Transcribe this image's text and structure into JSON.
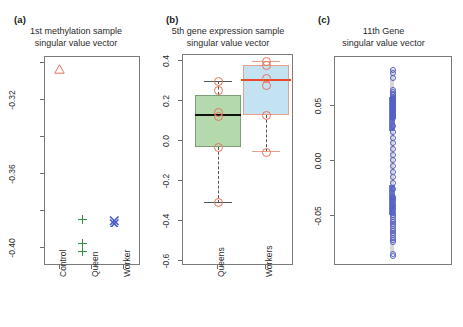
{
  "figure": {
    "background": "#ffffff",
    "width": 463,
    "height": 327
  },
  "panels": [
    {
      "letter": "(a)",
      "title_line1": "1st methylation sample",
      "title_line2": "singular value vector",
      "xlabels": [
        "Control",
        "Queen",
        "Worker"
      ],
      "ylabels": [
        "-0.32",
        "-0.36",
        "-0.40"
      ]
    },
    {
      "letter": "(b)",
      "title_line1": "5th gene expression sample",
      "title_line2": "singular value vector",
      "xlabels": [
        "Queens",
        "Workers"
      ],
      "ylabels": [
        "0.4",
        "0.2",
        "0.0",
        "-0.2",
        "-0.4",
        "-0.6"
      ]
    },
    {
      "letter": "(c)",
      "title_line1": "11th Gene",
      "title_line2": "singular value vector",
      "xlabels": [],
      "ylabels": [
        "0.05",
        "0.00",
        "-0.05"
      ]
    }
  ],
  "chart_data": [
    {
      "type": "scatter",
      "panel": "(a)",
      "title": "1st methylation sample singular value vector",
      "xlabel": "",
      "ylabel": "",
      "categories": [
        "Control",
        "Queen",
        "Worker"
      ],
      "ylim": [
        -0.415,
        -0.298
      ],
      "yticks": [
        -0.32,
        -0.36,
        -0.4
      ],
      "grid": false,
      "legend": "none",
      "series": [
        {
          "name": "Control",
          "marker": "triangle",
          "color": "#e8735a",
          "x": [
            "Control"
          ],
          "values": [
            -0.302
          ]
        },
        {
          "name": "Queen",
          "marker": "plus",
          "color": "#2f8f3f",
          "x": [
            "Queen",
            "Queen",
            "Queen"
          ],
          "values": [
            -0.386,
            -0.397,
            -0.401
          ]
        },
        {
          "name": "Worker",
          "marker": "cross",
          "color": "#4858c8",
          "x": [
            "Worker",
            "Worker"
          ],
          "values": [
            -0.387,
            -0.389
          ]
        }
      ]
    },
    {
      "type": "boxplot",
      "panel": "(b)",
      "title": "5th gene expression sample singular value vector",
      "xlabel": "",
      "ylabel": "",
      "categories": [
        "Queens",
        "Workers"
      ],
      "ylim": [
        -0.63,
        0.44
      ],
      "yticks": [
        0.4,
        0.2,
        0.0,
        -0.2,
        -0.4,
        -0.6
      ],
      "grid": false,
      "legend": "none",
      "boxes": [
        {
          "name": "Queens",
          "fill": "#b3d9ac",
          "border": "#7a9a74",
          "median_color": "#111111",
          "min": -0.56,
          "q1": -0.28,
          "median": -0.12,
          "q3": -0.02,
          "max": 0.0,
          "points": [
            0.0,
            -0.045,
            -0.11,
            -0.12,
            -0.28,
            -0.56
          ]
        },
        {
          "name": "Workers",
          "fill": "#c3e2f2",
          "border": "#e8a08a",
          "median_color": "#e8492b",
          "min": -0.055,
          "q1": 0.13,
          "median": 0.3,
          "q3": 0.38,
          "max": 0.4,
          "points": [
            0.4,
            0.395,
            0.305,
            0.29,
            0.13,
            -0.055
          ]
        }
      ]
    },
    {
      "type": "scatter",
      "panel": "(c)",
      "title": "11th Gene singular value vector",
      "xlabel": "",
      "ylabel": "",
      "categories": [],
      "ylim": [
        -0.088,
        0.085
      ],
      "yticks": [
        0.05,
        0.0,
        -0.05
      ],
      "grid": false,
      "legend": "none",
      "description": "dense single-column strip chart of gene loadings",
      "series": [
        {
          "name": "11th Gene loadings",
          "marker": "open-circle",
          "color": "#5560c4",
          "values": [
            0.079,
            0.077,
            0.072,
            0.062,
            0.06,
            0.058,
            0.057,
            0.056,
            0.055,
            0.054,
            0.053,
            0.052,
            0.051,
            0.05,
            0.049,
            0.048,
            0.047,
            0.046,
            0.045,
            0.044,
            0.043,
            0.042,
            0.041,
            0.04,
            0.039,
            0.038,
            0.037,
            0.03,
            0.025,
            0.02,
            0.015,
            0.01,
            0.005,
            0.0,
            -0.005,
            -0.01,
            -0.015,
            -0.02,
            -0.025,
            -0.032,
            -0.034,
            -0.036,
            -0.038,
            -0.04,
            -0.042,
            -0.044,
            -0.046,
            -0.048,
            -0.05,
            -0.052,
            -0.054,
            -0.056,
            -0.058,
            -0.06,
            -0.062,
            -0.064,
            -0.066,
            -0.068,
            -0.07,
            -0.072,
            -0.082,
            -0.084
          ]
        }
      ]
    }
  ]
}
